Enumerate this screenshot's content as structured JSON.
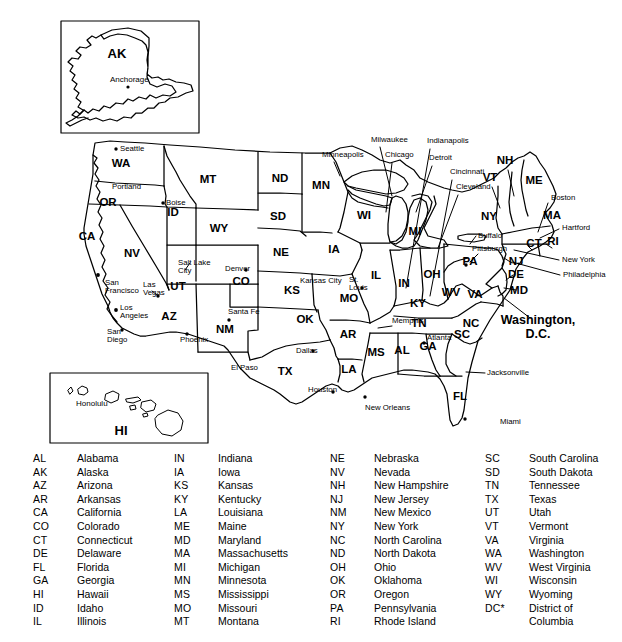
{
  "figure": {
    "style": {
      "line_color": "#000000",
      "fill_color": "#ffffff",
      "background": "#ffffff"
    }
  },
  "insets": [
    {
      "name": "alaska-inset",
      "label": "AK",
      "cities": [
        "Anchorage"
      ]
    },
    {
      "name": "hawaii-inset",
      "label": "HI",
      "cities": [
        "Honolulu"
      ]
    }
  ],
  "map": {
    "state_labels": [
      {
        "abbr": "WA",
        "x": 121,
        "y": 167
      },
      {
        "abbr": "OR",
        "x": 108,
        "y": 206
      },
      {
        "abbr": "CA",
        "x": 87,
        "y": 240
      },
      {
        "abbr": "NV",
        "x": 132,
        "y": 257
      },
      {
        "abbr": "ID",
        "x": 173,
        "y": 216
      },
      {
        "abbr": "MT",
        "x": 208,
        "y": 183
      },
      {
        "abbr": "WY",
        "x": 219,
        "y": 232
      },
      {
        "abbr": "UT",
        "x": 178,
        "y": 290
      },
      {
        "abbr": "AZ",
        "x": 169,
        "y": 320
      },
      {
        "abbr": "NM",
        "x": 225,
        "y": 333
      },
      {
        "abbr": "CO",
        "x": 241,
        "y": 285
      },
      {
        "abbr": "ND",
        "x": 280,
        "y": 182
      },
      {
        "abbr": "SD",
        "x": 278,
        "y": 220
      },
      {
        "abbr": "NE",
        "x": 281,
        "y": 256
      },
      {
        "abbr": "KS",
        "x": 292,
        "y": 294
      },
      {
        "abbr": "OK",
        "x": 305,
        "y": 323
      },
      {
        "abbr": "TX",
        "x": 285,
        "y": 375
      },
      {
        "abbr": "MN",
        "x": 321,
        "y": 189
      },
      {
        "abbr": "IA",
        "x": 334,
        "y": 253
      },
      {
        "abbr": "MO",
        "x": 349,
        "y": 302
      },
      {
        "abbr": "AR",
        "x": 348,
        "y": 338
      },
      {
        "abbr": "LA",
        "x": 349,
        "y": 373
      },
      {
        "abbr": "WI",
        "x": 364,
        "y": 219
      },
      {
        "abbr": "IL",
        "x": 376,
        "y": 279
      },
      {
        "abbr": "MS",
        "x": 376,
        "y": 356
      },
      {
        "abbr": "MI",
        "x": 415,
        "y": 235
      },
      {
        "abbr": "IN",
        "x": 404,
        "y": 287
      },
      {
        "abbr": "KY",
        "x": 418,
        "y": 307
      },
      {
        "abbr": "TN",
        "x": 419,
        "y": 327
      },
      {
        "abbr": "AL",
        "x": 402,
        "y": 354
      },
      {
        "abbr": "GA",
        "x": 428,
        "y": 350
      },
      {
        "abbr": "OH",
        "x": 432,
        "y": 278
      },
      {
        "abbr": "WV",
        "x": 451,
        "y": 296
      },
      {
        "abbr": "VA",
        "x": 475,
        "y": 298
      },
      {
        "abbr": "NC",
        "x": 471,
        "y": 327
      },
      {
        "abbr": "SC",
        "x": 462,
        "y": 338
      },
      {
        "abbr": "FL",
        "x": 460,
        "y": 400
      },
      {
        "abbr": "PA",
        "x": 470,
        "y": 265
      },
      {
        "abbr": "NY",
        "x": 489,
        "y": 220
      },
      {
        "abbr": "VT",
        "x": 490,
        "y": 181
      },
      {
        "abbr": "NH",
        "x": 505,
        "y": 164
      },
      {
        "abbr": "ME",
        "x": 534,
        "y": 184
      },
      {
        "abbr": "MA",
        "x": 552,
        "y": 219
      },
      {
        "abbr": "CT",
        "x": 534,
        "y": 247
      },
      {
        "abbr": "RI",
        "x": 553,
        "y": 245
      },
      {
        "abbr": "NJ",
        "x": 516,
        "y": 265
      },
      {
        "abbr": "DE",
        "x": 516,
        "y": 278
      },
      {
        "abbr": "MD",
        "x": 519,
        "y": 294
      }
    ],
    "dc_label": {
      "line1": "Washington,",
      "line2": "D.C.",
      "x": 538,
      "y": 324
    },
    "cities": [
      {
        "name": "Seattle",
        "x": 120,
        "y": 151
      },
      {
        "name": "Portland",
        "x": 112,
        "y": 189
      },
      {
        "name": "Boise",
        "x": 166,
        "y": 205
      },
      {
        "name": "San Francisco",
        "x": 105,
        "y": 285
      },
      {
        "name": "Los Angeles",
        "x": 120,
        "y": 310
      },
      {
        "name": "San Diego",
        "x": 107,
        "y": 334
      },
      {
        "name": "Las Vegas",
        "x": 143,
        "y": 287
      },
      {
        "name": "Salt Lake City",
        "x": 178,
        "y": 265
      },
      {
        "name": "Phoenix",
        "x": 180,
        "y": 342
      },
      {
        "name": "Santa Fe",
        "x": 228,
        "y": 314
      },
      {
        "name": "Denver",
        "x": 225,
        "y": 271
      },
      {
        "name": "El Paso",
        "x": 231,
        "y": 370
      },
      {
        "name": "Dallas",
        "x": 296,
        "y": 353
      },
      {
        "name": "Houston",
        "x": 308,
        "y": 392
      },
      {
        "name": "New Orleans",
        "x": 365,
        "y": 410
      },
      {
        "name": "Kansas City",
        "x": 300,
        "y": 283
      },
      {
        "name": "St. Louis",
        "x": 349,
        "y": 282
      },
      {
        "name": "Memphis",
        "x": 392,
        "y": 323
      },
      {
        "name": "Atlanta",
        "x": 427,
        "y": 340
      },
      {
        "name": "Minneapolis",
        "x": 322,
        "y": 157
      },
      {
        "name": "Milwaukee",
        "x": 371,
        "y": 142
      },
      {
        "name": "Chicago",
        "x": 385,
        "y": 157
      },
      {
        "name": "Indianapolis",
        "x": 427,
        "y": 143
      },
      {
        "name": "Detroit",
        "x": 429,
        "y": 160
      },
      {
        "name": "Cincinnati",
        "x": 450,
        "y": 174
      },
      {
        "name": "Cleveland",
        "x": 456,
        "y": 189
      },
      {
        "name": "Buffalo",
        "x": 478,
        "y": 238
      },
      {
        "name": "Pittsburgh",
        "x": 472,
        "y": 251
      },
      {
        "name": "Boston",
        "x": 551,
        "y": 200
      },
      {
        "name": "Hartford",
        "x": 562,
        "y": 230
      },
      {
        "name": "New York",
        "x": 562,
        "y": 262
      },
      {
        "name": "Philadelphia",
        "x": 563,
        "y": 277
      },
      {
        "name": "Jacksonville",
        "x": 487,
        "y": 375
      },
      {
        "name": "Miami",
        "x": 500,
        "y": 424
      }
    ]
  },
  "legend": {
    "columns": [
      {
        "name": "legend-column-1",
        "entries": [
          {
            "abbr": "AL",
            "state": "Alabama"
          },
          {
            "abbr": "AK",
            "state": "Alaska"
          },
          {
            "abbr": "AZ",
            "state": "Arizona"
          },
          {
            "abbr": "AR",
            "state": "Arkansas"
          },
          {
            "abbr": "CA",
            "state": "California"
          },
          {
            "abbr": "CO",
            "state": "Colorado"
          },
          {
            "abbr": "CT",
            "state": "Connecticut"
          },
          {
            "abbr": "DE",
            "state": "Delaware"
          },
          {
            "abbr": "FL",
            "state": "Florida"
          },
          {
            "abbr": "GA",
            "state": "Georgia"
          },
          {
            "abbr": "HI",
            "state": "Hawaii"
          },
          {
            "abbr": "ID",
            "state": "Idaho"
          },
          {
            "abbr": "IL",
            "state": "Illinois"
          }
        ]
      },
      {
        "name": "legend-column-2",
        "entries": [
          {
            "abbr": "IN",
            "state": "Indiana"
          },
          {
            "abbr": "IA",
            "state": "Iowa"
          },
          {
            "abbr": "KS",
            "state": "Kansas"
          },
          {
            "abbr": "KY",
            "state": "Kentucky"
          },
          {
            "abbr": "LA",
            "state": "Louisiana"
          },
          {
            "abbr": "ME",
            "state": "Maine"
          },
          {
            "abbr": "MD",
            "state": "Maryland"
          },
          {
            "abbr": "MA",
            "state": "Massachusetts"
          },
          {
            "abbr": "MI",
            "state": "Michigan"
          },
          {
            "abbr": "MN",
            "state": "Minnesota"
          },
          {
            "abbr": "MS",
            "state": "Mississippi"
          },
          {
            "abbr": "MO",
            "state": "Missouri"
          },
          {
            "abbr": "MT",
            "state": "Montana"
          }
        ]
      },
      {
        "name": "legend-column-3",
        "entries": [
          {
            "abbr": "NE",
            "state": "Nebraska"
          },
          {
            "abbr": "NV",
            "state": "Nevada"
          },
          {
            "abbr": "NH",
            "state": "New Hampshire"
          },
          {
            "abbr": "NJ",
            "state": "New Jersey"
          },
          {
            "abbr": "NM",
            "state": "New Mexico"
          },
          {
            "abbr": "NY",
            "state": "New York"
          },
          {
            "abbr": "NC",
            "state": "North Carolina"
          },
          {
            "abbr": "ND",
            "state": "North Dakota"
          },
          {
            "abbr": "OH",
            "state": "Ohio"
          },
          {
            "abbr": "OK",
            "state": "Oklahoma"
          },
          {
            "abbr": "OR",
            "state": "Oregon"
          },
          {
            "abbr": "PA",
            "state": "Pennsylvania"
          },
          {
            "abbr": "RI",
            "state": "Rhode Island"
          }
        ]
      },
      {
        "name": "legend-column-4",
        "entries": [
          {
            "abbr": "SC",
            "state": "South Carolina"
          },
          {
            "abbr": "SD",
            "state": "South Dakota"
          },
          {
            "abbr": "TN",
            "state": "Tennessee"
          },
          {
            "abbr": "TX",
            "state": "Texas"
          },
          {
            "abbr": "UT",
            "state": "Utah"
          },
          {
            "abbr": "VT",
            "state": "Vermont"
          },
          {
            "abbr": "VA",
            "state": "Virginia"
          },
          {
            "abbr": "WA",
            "state": "Washington"
          },
          {
            "abbr": "WV",
            "state": "West Virginia"
          },
          {
            "abbr": "WI",
            "state": "Wisconsin"
          },
          {
            "abbr": "WY",
            "state": "Wyoming"
          },
          {
            "abbr": "DC*",
            "state": "District of"
          },
          {
            "abbr": "",
            "state": "Columbia",
            "continuation": true
          }
        ]
      }
    ]
  }
}
